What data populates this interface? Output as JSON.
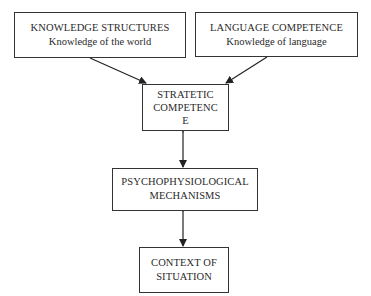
{
  "diagram": {
    "nodes": {
      "knowledge": {
        "title": "KNOWLEDGE STRUCTURES",
        "subtitle": "Knowledge of the world"
      },
      "language": {
        "title": "LANGUAGE COMPETENCE",
        "subtitle": "Knowledge of language"
      },
      "strategic": {
        "line1": "STRATETIC",
        "line2": "COMPETENC",
        "line3": "E"
      },
      "psycho": {
        "line1": "PSYCHOPHYSIOLOGICAL",
        "line2": "MECHANISMS"
      },
      "context": {
        "line1": "CONTEXT OF",
        "line2": "SITUATION"
      }
    },
    "edges": [
      {
        "from": "knowledge",
        "to": "strategic",
        "type": "one-way"
      },
      {
        "from": "language",
        "to": "strategic",
        "type": "one-way"
      },
      {
        "from": "strategic",
        "to": "psycho",
        "type": "two-way"
      },
      {
        "from": "psycho",
        "to": "context",
        "type": "two-way"
      }
    ],
    "colors": {
      "line": "#222222",
      "border": "#333333",
      "text": "#2a2a2a"
    }
  }
}
